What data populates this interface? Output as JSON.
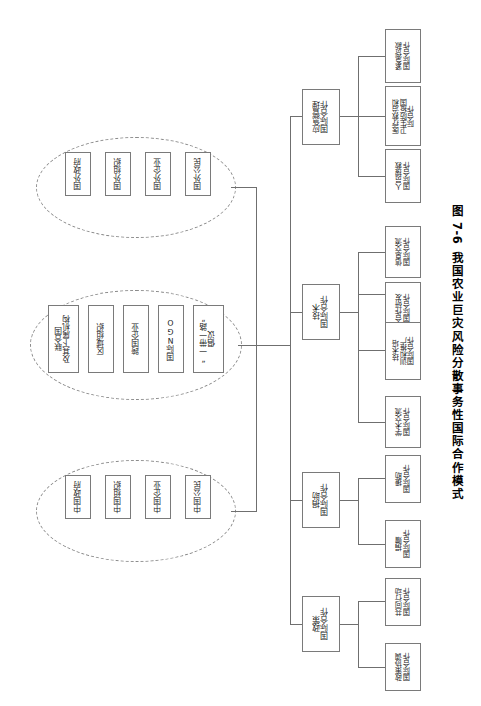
{
  "figure": {
    "number": "图 7-6",
    "title": "我国农业巨灾风险分散事务性国际合作模式",
    "orientation": "rotated-90-clockwise",
    "line_color": "#6f6f6f",
    "box_border_color": "#7a7a7a",
    "ellipse_border_color": "#8a8a8a",
    "background": "#ffffff"
  },
  "actor_groups": [
    {
      "id": "foreign",
      "name": "国外主体",
      "members": [
        {
          "label": "国外政府"
        },
        {
          "label": "国外组织"
        },
        {
          "label": "国外企业"
        },
        {
          "label": "国外公民"
        }
      ]
    },
    {
      "id": "international",
      "name": "国际主体",
      "members": [
        {
          "label": "联合国\n及其下属机构",
          "line1": "联合国",
          "line2": "及其下属机构"
        },
        {
          "label": "区域组织"
        },
        {
          "label": "跨国企业"
        },
        {
          "label": "国际NGO"
        },
        {
          "label": "“一带一路”\n倡议",
          "line1": "“一带一路”",
          "line2": "倡议"
        }
      ]
    },
    {
      "id": "chinese",
      "name": "中国主体",
      "members": [
        {
          "label": "中国政府"
        },
        {
          "label": "中国组织"
        },
        {
          "label": "中国企业"
        },
        {
          "label": "中国公民"
        }
      ]
    }
  ],
  "categories": [
    {
      "id": "emergency",
      "line1": "应急管理",
      "line2": "国际合作",
      "children": [
        {
          "line1": "紧急贷款",
          "line2": "国际合作"
        },
        {
          "line1": "医疗救治和",
          "line2": "卫生防疫国",
          "line3": "际合作"
        },
        {
          "line1": "人员搜救",
          "line2": "国际合作"
        }
      ]
    },
    {
      "id": "technology",
      "line1": "技术",
      "line2": "国际合作",
      "children": [
        {
          "line1": "信息交流",
          "line2": "国际合作"
        },
        {
          "line1": "合作研发",
          "line2": "国际合作"
        },
        {
          "line1": "技术培",
          "line2": "训和推广",
          "line3": "国际合作"
        },
        {
          "line1": "学术交流",
          "line2": "国际合作"
        }
      ]
    },
    {
      "id": "donation",
      "line1": "捐助",
      "line2": "国际合作",
      "children": [
        {
          "line1": "援助",
          "line2": "国际合作"
        },
        {
          "line1": "捐赠",
          "line2": "国际合作"
        }
      ]
    },
    {
      "id": "policy",
      "line1": "政策",
      "line2": "国际合作",
      "children": [
        {
          "line1": "共同行动",
          "line2": "国际合作"
        },
        {
          "line1": "政策协调",
          "line2": "国际合作"
        }
      ]
    }
  ]
}
